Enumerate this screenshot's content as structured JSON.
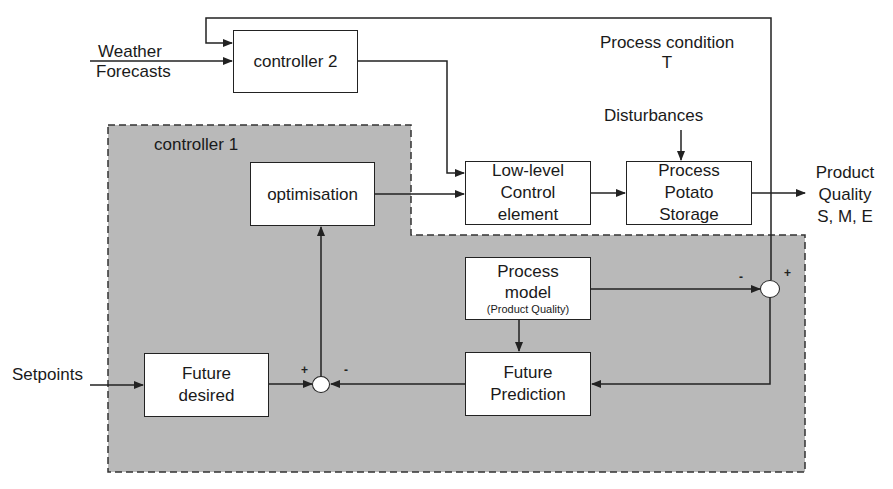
{
  "diagram": {
    "inputs": {
      "weather": [
        "Weather",
        "Forecasts"
      ],
      "setpoints": "Setpoints",
      "disturbances": "Disturbances",
      "process_condition": [
        "Process condition",
        "T"
      ]
    },
    "outputs": {
      "product_quality": [
        "Product",
        "Quality",
        "S, M, E"
      ]
    },
    "regions": {
      "controller1": "controller 1"
    },
    "blocks": {
      "controller2": "controller 2",
      "optimisation": "optimisation",
      "low_level": [
        "Low-level",
        "Control",
        "element"
      ],
      "process": [
        "Process",
        "Potato",
        "Storage"
      ],
      "process_model": [
        "Process",
        "model",
        "(Product Quality)"
      ],
      "future_prediction": [
        "Future",
        "Prediction"
      ],
      "future_desired": [
        "Future",
        "desired"
      ]
    },
    "signs": {
      "lower_plus": "+",
      "lower_minus": "-",
      "right_minus": "-",
      "right_plus": "+"
    },
    "colors": {
      "region_fill": "#b9b9b9",
      "line": "#222222",
      "box_fill": "#ffffff"
    }
  }
}
